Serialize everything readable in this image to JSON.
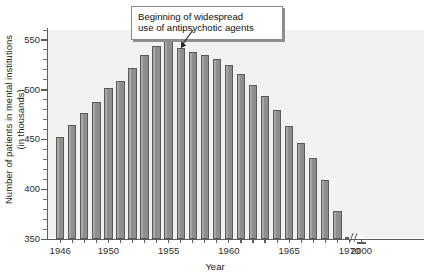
{
  "chart_data": {
    "type": "bar",
    "title": "",
    "xlabel": "Year",
    "ylabel": "Number of patients in mental institutions (in thousands)",
    "ylim": [
      350,
      560
    ],
    "grid": false,
    "legend": "none",
    "y_ticks_major": [
      350,
      400,
      450,
      500,
      550
    ],
    "y_tick_minor_step": 10,
    "x_axis_break_between": [
      1970,
      2000
    ],
    "categories": [
      "1946",
      "1947",
      "1948",
      "1949",
      "1950",
      "1951",
      "1952",
      "1953",
      "1954",
      "1955",
      "1956",
      "1957",
      "1958",
      "1959",
      "1960",
      "1961",
      "1962",
      "1963",
      "1964",
      "1965",
      "1966",
      "1967",
      "1968",
      "1969",
      "1970",
      "2000"
    ],
    "x_tick_labels": [
      "1946",
      "1950",
      "1955",
      "1960",
      "1965",
      "1970",
      "2000"
    ],
    "values": [
      452,
      465,
      477,
      488,
      502,
      509,
      522,
      535,
      544,
      549,
      542,
      538,
      535,
      531,
      525,
      516,
      505,
      494,
      480,
      464,
      446,
      431,
      409,
      378,
      352,
      347
    ],
    "annotations": [
      {
        "text_line1": "Beginning of widespread",
        "text_line2": "use of antipsychotic agents",
        "points_to_category": "1956"
      }
    ]
  },
  "axis": {
    "y_labels": [
      "550",
      "500",
      "450",
      "400",
      "350"
    ],
    "x_labels": [
      "1946",
      "1950",
      "1955",
      "1960",
      "1965",
      "1970",
      "2000"
    ],
    "y_title_line1": "Number of patients in mental institutions",
    "y_title_line2": "(in thousands)",
    "x_title": "Year"
  },
  "callout": {
    "line1": "Beginning of widespread",
    "line2": "use of antipsychotic agents"
  },
  "colors": {
    "bar_fill": "#8e8e8e",
    "bar_stroke": "#5a5a5a",
    "plot_background": "#f2f2f0",
    "axis": "#5d5d5d",
    "text": "#1a1a1a"
  }
}
